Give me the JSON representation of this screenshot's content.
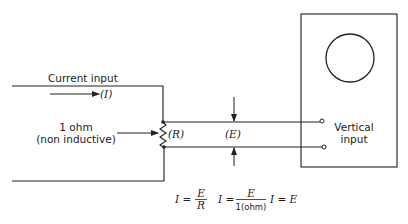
{
  "diagram": {
    "labels": {
      "current_input": "Current input",
      "current_symbol": "(I)",
      "resistor_value": "1 ohm",
      "resistor_note": "(non inductive)",
      "resistor_symbol": "(R)",
      "voltage_symbol": "(E)",
      "vertical_input_line1": "Vertical",
      "vertical_input_line2": "input"
    },
    "equations": {
      "eq1_lhs": "I =",
      "eq1_num": "E",
      "eq1_den": "R",
      "eq2_lhs": "I =",
      "eq2_num": "E",
      "eq2_den": "1(ohm)",
      "eq3": "I = E"
    },
    "colors": {
      "line": "#222222",
      "background": "#ffffff"
    }
  }
}
